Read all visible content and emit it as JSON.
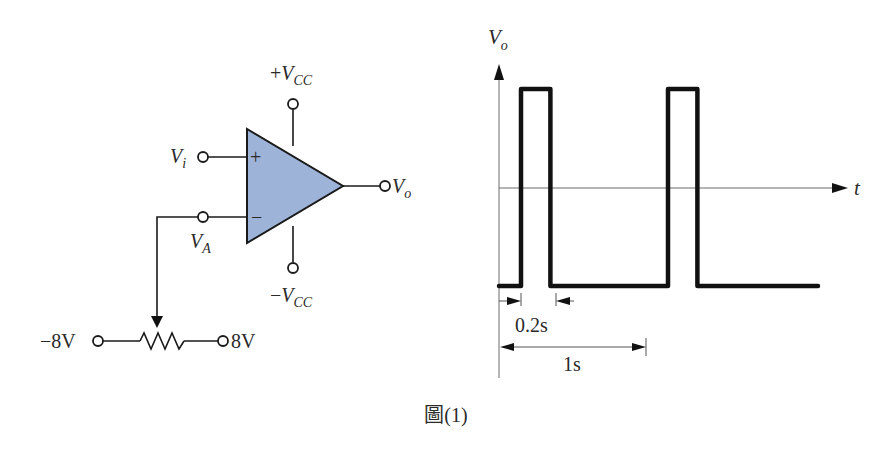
{
  "figure": {
    "caption": "圖(1)"
  },
  "circuit": {
    "opamp_fill": "#9db3d8",
    "opamp_plus_sign": "+",
    "opamp_minus_sign": "−",
    "labels": {
      "vcc_pos_sign": "+",
      "vcc_neg_sign": "−",
      "v_main": "V",
      "vcc_sub": "CC",
      "vi_sub": "i",
      "va_sub": "A",
      "vo_sub": "o"
    },
    "potentiometer": {
      "left_voltage": "−8V",
      "right_voltage": "8V"
    }
  },
  "waveform": {
    "y_axis_label_main": "V",
    "y_axis_label_sub": "o",
    "x_axis_label": "t",
    "pulse_width_label": "0.2s",
    "period_label": "1s",
    "pulse_width_s": 0.2,
    "period_s": 1.0,
    "pulses_shown": 2
  }
}
